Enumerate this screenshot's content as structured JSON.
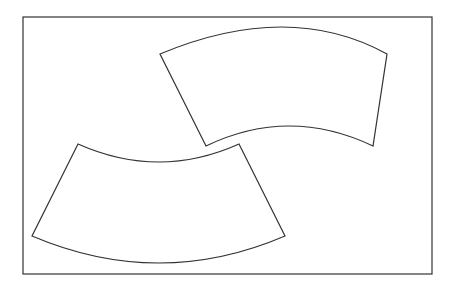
{
  "diagram": {
    "stroke_color": "#333333",
    "background": "#ffffff",
    "frame": {
      "x": 23,
      "y": 17,
      "width": 409,
      "height": 257
    },
    "shapes": [
      {
        "name": "upper-right-arch",
        "top_left": [
          160,
          54
        ],
        "top_right": [
          387,
          54
        ],
        "bottom_right": [
          373,
          146
        ],
        "bottom_left": [
          206,
          146
        ],
        "outer_arc_peak": [
          289,
          25
        ],
        "inner_arc_peak": [
          289,
          126
        ]
      },
      {
        "name": "lower-left-arch",
        "top_left": [
          78,
          144
        ],
        "top_right": [
          239,
          144
        ],
        "bottom_right": [
          285,
          236
        ],
        "bottom_left": [
          32,
          236
        ],
        "inner_arc_low": [
          159,
          162
        ],
        "outer_arc_low": [
          159,
          263
        ]
      }
    ]
  }
}
